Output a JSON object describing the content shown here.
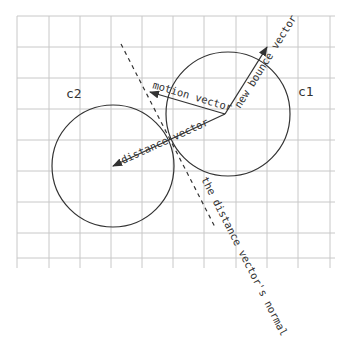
{
  "diagram": {
    "colors": {
      "grid": "#c8c8c8",
      "stroke": "#333333",
      "background": "#ffffff"
    },
    "grid": {
      "x_lines": [
        17,
        49,
        80,
        111,
        142,
        173,
        204,
        236,
        267,
        298,
        330
      ],
      "y_lines": [
        16,
        47,
        78,
        109,
        140,
        171,
        202,
        233,
        258
      ],
      "x_start": 17,
      "x_end": 335,
      "y_start": 16,
      "y_end": 268
    },
    "circles": [
      {
        "id": "c1",
        "label": "c1",
        "cx": 228,
        "cy": 114,
        "r": 62,
        "label_x": 298,
        "label_y": 96
      },
      {
        "id": "c2",
        "label": "c2",
        "cx": 113,
        "cy": 166,
        "r": 61,
        "label_x": 66,
        "label_y": 98
      }
    ],
    "vectors": [
      {
        "id": "motion",
        "label": "motion vector",
        "from": [
          225,
          114
        ],
        "to": [
          150,
          92
        ]
      },
      {
        "id": "distance",
        "label": "distance vector",
        "from": [
          225,
          114
        ],
        "to": [
          113,
          166
        ]
      },
      {
        "id": "bounce",
        "label": "new bounce vector",
        "from": [
          225,
          114
        ],
        "to": [
          267,
          47
        ]
      }
    ],
    "normal": {
      "label": "the distance vector's normal",
      "from": [
        121,
        44
      ],
      "to": [
        216,
        229
      ]
    }
  }
}
